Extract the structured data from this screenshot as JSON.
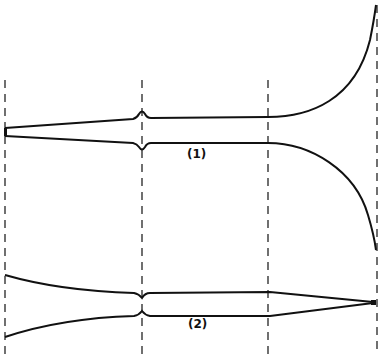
{
  "figure": {
    "labels": [
      {
        "id": "profile-1",
        "text": "(1)",
        "x": 187,
        "y": 147
      },
      {
        "id": "profile-2",
        "text": "(2)",
        "x": 188,
        "y": 317
      }
    ],
    "dashed_lines_x": [
      7,
      142,
      268,
      377
    ],
    "colors": {
      "ink": "#111111",
      "background": "#ffffff"
    }
  }
}
